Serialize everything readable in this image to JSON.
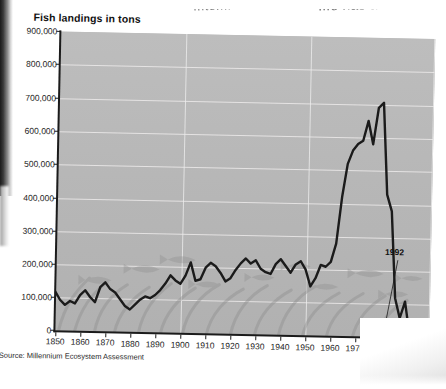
{
  "page_bleed": {
    "left_fragment": "...tem.",
    "right_fragment": "...e has also severe"
  },
  "chart": {
    "title": "Fish landings in tons",
    "source": "Source: Millennium Ecosystem Assessment",
    "annotation_label": "1992",
    "plot_background_color": "#b9b9b9",
    "gridline_color": "#ececec",
    "series_color": "#1b1b1b",
    "axis_color": "#1b1b1b"
  },
  "chart_data": {
    "type": "line",
    "title": "Fish landings in tons",
    "subtitle": "",
    "xlabel": "",
    "ylabel": "Fish landings in tons",
    "xlim": [
      1850,
      2000
    ],
    "ylim": [
      0,
      900000
    ],
    "grid": true,
    "legend_position": "none",
    "x_tick_labels": [
      "1850",
      "1860",
      "1870",
      "1880",
      "1890",
      "1900",
      "1910",
      "1920",
      "1930",
      "1940",
      "1950",
      "1960",
      "1970",
      "1980",
      "1990",
      "2000"
    ],
    "x_ticks": [
      1850,
      1860,
      1870,
      1880,
      1890,
      1900,
      1910,
      1920,
      1930,
      1940,
      1950,
      1960,
      1970,
      1980,
      1990,
      2000
    ],
    "y_tick_labels": [
      "0",
      "100,000",
      "200,000",
      "300,000",
      "400,000",
      "500,000",
      "600,000",
      "700,000",
      "800,000",
      "900,000"
    ],
    "y_ticks": [
      0,
      100000,
      200000,
      300000,
      400000,
      500000,
      600000,
      700000,
      800000,
      900000
    ],
    "annotations": [
      {
        "text": "1992",
        "x": 1992,
        "y": 10000,
        "note": "collapse of the cod fishery"
      }
    ],
    "series": [
      {
        "name": "Fish landings",
        "x": [
          1850,
          1852,
          1854,
          1856,
          1858,
          1860,
          1862,
          1864,
          1866,
          1868,
          1870,
          1872,
          1874,
          1876,
          1878,
          1880,
          1882,
          1884,
          1886,
          1888,
          1890,
          1892,
          1894,
          1896,
          1898,
          1900,
          1902,
          1904,
          1906,
          1908,
          1910,
          1912,
          1914,
          1916,
          1918,
          1920,
          1922,
          1924,
          1926,
          1928,
          1930,
          1932,
          1934,
          1936,
          1938,
          1940,
          1942,
          1944,
          1946,
          1948,
          1950,
          1952,
          1954,
          1956,
          1958,
          1960,
          1962,
          1964,
          1966,
          1968,
          1970,
          1972,
          1974,
          1976,
          1978,
          1980,
          1982,
          1984,
          1986,
          1988,
          1990,
          1992,
          1994,
          1996,
          1998,
          2000
        ],
        "values": [
          120000,
          95000,
          80000,
          92000,
          85000,
          110000,
          125000,
          105000,
          90000,
          135000,
          150000,
          130000,
          120000,
          100000,
          80000,
          70000,
          85000,
          100000,
          110000,
          105000,
          115000,
          130000,
          150000,
          175000,
          160000,
          150000,
          175000,
          215000,
          160000,
          165000,
          200000,
          215000,
          205000,
          185000,
          160000,
          170000,
          195000,
          215000,
          230000,
          215000,
          225000,
          200000,
          190000,
          185000,
          215000,
          230000,
          210000,
          190000,
          215000,
          225000,
          200000,
          150000,
          175000,
          215000,
          210000,
          225000,
          280000,
          420000,
          520000,
          560000,
          580000,
          590000,
          650000,
          580000,
          690000,
          705000,
          430000,
          380000,
          120000,
          60000,
          110000,
          12000,
          8000,
          6000,
          5000,
          4000
        ]
      }
    ]
  },
  "y_axis_ticks": [
    {
      "label": "900,000",
      "top": 31
    },
    {
      "label": "800,000",
      "top": 64
    },
    {
      "label": "700,000",
      "top": 98
    },
    {
      "label": "600,000",
      "top": 131
    },
    {
      "label": "500,000",
      "top": 164
    },
    {
      "label": "400,000",
      "top": 198
    },
    {
      "label": "300,000",
      "top": 231
    },
    {
      "label": "200,000",
      "top": 264
    },
    {
      "label": "100,000",
      "top": 297
    },
    {
      "label": "0",
      "top": 330
    }
  ],
  "x_axis_ticks": [
    {
      "label": "1850",
      "left": 58
    },
    {
      "label": "1860",
      "left": 83
    },
    {
      "label": "1870",
      "left": 108
    },
    {
      "label": "1880",
      "left": 133
    },
    {
      "label": "1890",
      "left": 158
    },
    {
      "label": "1900",
      "left": 183
    },
    {
      "label": "1910",
      "left": 208
    },
    {
      "label": "1920",
      "left": 233
    },
    {
      "label": "1930",
      "left": 258
    },
    {
      "label": "1940",
      "left": 283
    },
    {
      "label": "1950",
      "left": 308
    },
    {
      "label": "1960",
      "left": 333
    },
    {
      "label": "1970",
      "left": 358
    },
    {
      "label": "1980",
      "left": 383
    },
    {
      "label": "1990",
      "left": 408
    },
    {
      "label": "2000",
      "left": 431
    }
  ]
}
